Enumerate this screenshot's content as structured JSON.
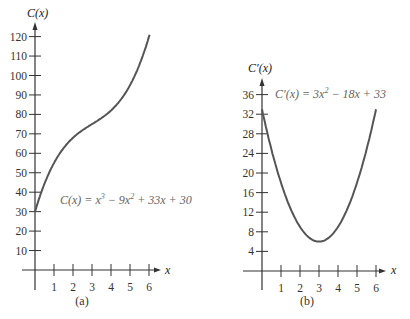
{
  "chart_data": [
    {
      "type": "line",
      "panel": "(a)",
      "title": "",
      "xlabel": "x",
      "ylabel": "C(x)",
      "equation": "C(x) = x^3 - 9x^2 + 33x + 30",
      "equation_display": {
        "c": "C(x) = x",
        "e1": "3",
        "m": " − 9x",
        "e2": "2",
        "r": " + 33x + 30"
      },
      "xticks": [
        1,
        2,
        3,
        4,
        5,
        6
      ],
      "yticks": [
        10,
        20,
        30,
        40,
        50,
        60,
        70,
        80,
        90,
        100,
        110,
        120
      ],
      "xlim": [
        0,
        6.5
      ],
      "ylim": [
        0,
        125
      ],
      "grid": false,
      "x": [
        0,
        0.5,
        1,
        1.5,
        2,
        2.5,
        3,
        3.5,
        4,
        4.5,
        5,
        5.5,
        6
      ],
      "values": [
        30,
        44.4,
        55,
        62.6,
        68,
        71.6,
        75,
        79.4,
        86,
        96.1,
        111,
        131.6,
        156
      ],
      "caption": "(a)"
    },
    {
      "type": "line",
      "panel": "(b)",
      "title": "",
      "xlabel": "x",
      "ylabel": "C′(x)",
      "equation": "C′(x) = 3x^2 - 18x + 33",
      "equation_display": {
        "c": "C′(x) = 3x",
        "e1": "2",
        "r": " − 18x + 33"
      },
      "xticks": [
        1,
        2,
        3,
        4,
        5,
        6
      ],
      "yticks": [
        4,
        8,
        12,
        16,
        20,
        24,
        28,
        32,
        36
      ],
      "xlim": [
        0,
        6.5
      ],
      "ylim": [
        0,
        38
      ],
      "grid": false,
      "x": [
        0,
        0.5,
        1,
        1.5,
        2,
        2.5,
        3,
        3.5,
        4,
        4.5,
        5,
        5.5,
        6
      ],
      "values": [
        33,
        24.75,
        18,
        12.75,
        9,
        6.75,
        6,
        6.75,
        9,
        12.75,
        18,
        24.75,
        33
      ],
      "caption": "(b)"
    }
  ]
}
